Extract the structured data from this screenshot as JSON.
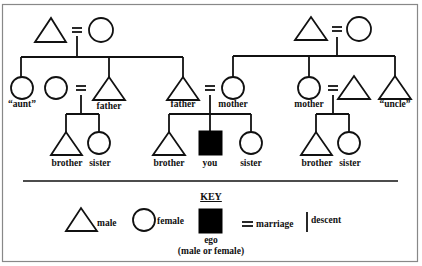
{
  "diagram": {
    "type": "kinship-chart",
    "colors": {
      "line": "#111111",
      "ego_fill": "#000000",
      "background": "#ffffff",
      "frame": "#888888"
    },
    "left_family": {
      "grandparents": {
        "male": "triangle",
        "female": "circle",
        "marriage": "="
      },
      "children": [
        {
          "label": "“aunt”",
          "shape": "circle"
        },
        {
          "label": "father",
          "shape": "triangle",
          "spouse_shape": "circle"
        },
        {
          "label": "father",
          "shape": "triangle",
          "spouse_label": "mother"
        }
      ],
      "father_children": [
        {
          "label": "brother",
          "shape": "triangle"
        },
        {
          "label": "sister",
          "shape": "circle"
        }
      ]
    },
    "ego_family": {
      "children": [
        {
          "label": "brother",
          "shape": "triangle"
        },
        {
          "label": "you",
          "shape": "filled-square"
        },
        {
          "label": "sister",
          "shape": "circle"
        }
      ]
    },
    "right_family": {
      "grandparents": {
        "male": "triangle",
        "female": "circle",
        "marriage": "="
      },
      "children": [
        {
          "label": "mother",
          "shape": "circle"
        },
        {
          "label": "mother",
          "shape": "circle",
          "spouse_shape": "triangle"
        },
        {
          "label": "“uncle”",
          "shape": "triangle"
        }
      ],
      "mother_children": [
        {
          "label": "brother",
          "shape": "triangle"
        },
        {
          "label": "sister",
          "shape": "circle"
        }
      ]
    },
    "labels": {
      "aunt": "“aunt”",
      "father_left": "father",
      "father_ego": "father",
      "mother_ego": "mother",
      "mother_right": "mother",
      "uncle": "“uncle”",
      "left_brother": "brother",
      "left_sister": "sister",
      "ego_brother": "brother",
      "ego_you": "you",
      "ego_sister": "sister",
      "right_brother": "brother",
      "right_sister": "sister"
    }
  },
  "key": {
    "title": "KEY",
    "items": [
      {
        "symbol": "triangle",
        "label": "male"
      },
      {
        "symbol": "circle",
        "label": "female"
      },
      {
        "symbol": "filled-square",
        "label": "ego",
        "sublabel": "(male or female)"
      },
      {
        "symbol": "=",
        "label": "marriage"
      },
      {
        "symbol": "|",
        "label": "descent"
      }
    ]
  }
}
